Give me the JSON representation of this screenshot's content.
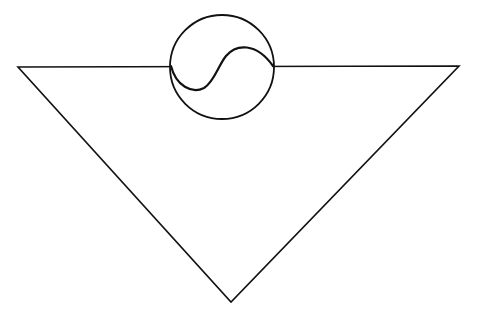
{
  "diagram": {
    "background": "#ffffff",
    "stroke": "#111111",
    "triangle": {
      "points": "18,67 459,66 231,302",
      "stroke_width": 1.6
    },
    "circle": {
      "cx": 222,
      "cy": 67,
      "r": 52,
      "stroke_width": 1.8
    },
    "s_curve": {
      "d": "M171,66 C176,86 192,94 204,88 C214,82 218,66 226,56 C236,44 256,42 273,66",
      "stroke_width": 2.2
    }
  }
}
